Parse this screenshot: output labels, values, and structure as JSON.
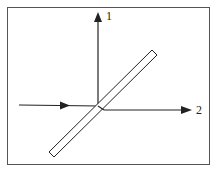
{
  "diagram": {
    "type": "beam-splitter",
    "labels": {
      "output_1": "1",
      "output_2": "2"
    },
    "colors": {
      "line": "#222222",
      "frame": "#555555",
      "background": "#ffffff"
    }
  }
}
